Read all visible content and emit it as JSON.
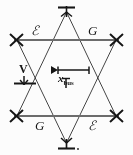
{
  "figure": {
    "type": "hexagram-geometry-diagram",
    "background_color": "#ffffff",
    "line_color": "#2b2b2b",
    "horizontal_rail_color": "#6e6e6e",
    "labels": {
      "top_left_region": "ℰ",
      "top_right_region": "G",
      "bottom_left_region": "G",
      "bottom_right_region": "ℰ",
      "vertical_dimension": "V",
      "horizontal_dimension_base": "x",
      "horizontal_dimension_sub": "bus"
    },
    "vertices": {
      "top": "T",
      "bottom": "T",
      "upper_left": "✕",
      "upper_right": "✕",
      "lower_left": "✕",
      "lower_right": "✕"
    },
    "dimensions": {
      "width_px": "133",
      "height_px": "155"
    }
  }
}
